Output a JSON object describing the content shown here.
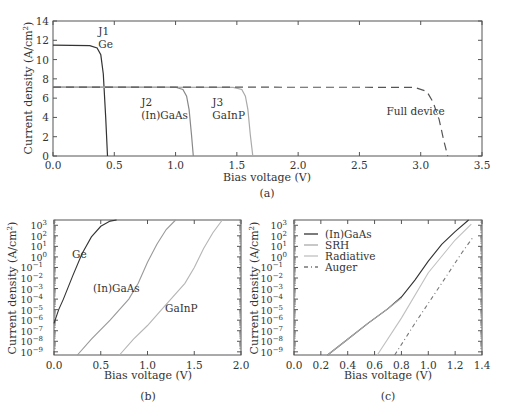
{
  "chart_data": [
    {
      "panel": "(a)",
      "type": "line",
      "title": "",
      "xlabel": "Bias voltage (V)",
      "ylabel": "Current density (A/cm²)",
      "xlim": [
        0,
        3.5
      ],
      "ylim": [
        0,
        14
      ],
      "xticks": [
        "0.0",
        "0.5",
        "1.0",
        "1.5",
        "2.0",
        "2.5",
        "3.0",
        "3.5"
      ],
      "yticks": [
        "0",
        "2",
        "4",
        "6",
        "8",
        "10",
        "12",
        "14"
      ],
      "grid": false,
      "series": [
        {
          "name": "J1 Ge",
          "style": "solid",
          "color": "#333333",
          "x": [
            0,
            0.3,
            0.36,
            0.39,
            0.41,
            0.43,
            0.445
          ],
          "y": [
            11.5,
            11.45,
            11.2,
            10.5,
            8.5,
            4,
            0
          ]
        },
        {
          "name": "J2 (In)GaAs",
          "style": "solid",
          "color": "#888888",
          "x": [
            0,
            1.0,
            1.06,
            1.09,
            1.11,
            1.13,
            1.145
          ],
          "y": [
            7.15,
            7.12,
            6.9,
            6.2,
            4.8,
            2.2,
            0
          ]
        },
        {
          "name": "J3 GaInP",
          "style": "solid",
          "color": "#aaaaaa",
          "x": [
            0,
            1.47,
            1.54,
            1.57,
            1.59,
            1.61,
            1.63
          ],
          "y": [
            7.15,
            7.12,
            6.9,
            6.2,
            4.8,
            2.2,
            0
          ]
        },
        {
          "name": "Full device",
          "style": "dashed",
          "color": "#555555",
          "x": [
            0,
            2.95,
            3.05,
            3.1,
            3.15,
            3.19,
            3.22
          ],
          "y": [
            7.15,
            7.12,
            6.7,
            5.6,
            3.8,
            1.5,
            0
          ]
        }
      ],
      "annotations": [
        {
          "text": "J1",
          "x": 0.37,
          "y": 12.5
        },
        {
          "text": "Ge",
          "x": 0.37,
          "y": 11.2
        },
        {
          "text": "J2",
          "x": 0.72,
          "y": 5.2
        },
        {
          "text": "(In)GaAs",
          "x": 0.72,
          "y": 3.8
        },
        {
          "text": "J3",
          "x": 1.3,
          "y": 5.2
        },
        {
          "text": "GaInP",
          "x": 1.3,
          "y": 3.8
        },
        {
          "text": "Full device",
          "x": 2.72,
          "y": 4.3
        }
      ]
    },
    {
      "panel": "(b)",
      "type": "line",
      "xlabel": "Bias voltage (V)",
      "ylabel": "Current density (A/cm²)",
      "xlim": [
        0,
        2.0
      ],
      "ylim": [
        "1e-9",
        "1e3"
      ],
      "yscale": "log",
      "xticks": [
        "0.0",
        "0.5",
        "1.0",
        "1.5",
        "2.0"
      ],
      "yticks": [
        "10^3",
        "10^2",
        "10^1",
        "10^0",
        "10^-1",
        "10^-2",
        "10^-3",
        "10^-4",
        "10^-5",
        "10^-6",
        "10^-7",
        "10^-8",
        "10^-9"
      ],
      "series": [
        {
          "name": "Ge",
          "style": "solid",
          "color": "#333333",
          "x": [
            0.0,
            0.05,
            0.1,
            0.2,
            0.3,
            0.4,
            0.5,
            0.6,
            0.67
          ],
          "log10_y": [
            -6.3,
            -5.0,
            -4.0,
            -1.8,
            0.3,
            1.9,
            2.9,
            3.4,
            3.5
          ]
        },
        {
          "name": "(In)GaAs",
          "style": "solid",
          "color": "#999999",
          "x": [
            0.25,
            0.4,
            0.6,
            0.8,
            0.9,
            1.0,
            1.1,
            1.2,
            1.3
          ],
          "log10_y": [
            -9.3,
            -7.8,
            -6.0,
            -4.0,
            -2.5,
            -0.5,
            1.2,
            2.6,
            3.5
          ]
        },
        {
          "name": "GaInP",
          "style": "solid",
          "color": "#b5b5b5",
          "x": [
            0.7,
            0.85,
            1.0,
            1.2,
            1.4,
            1.5,
            1.6,
            1.7,
            1.8
          ],
          "log10_y": [
            -9.3,
            -7.8,
            -6.5,
            -4.5,
            -2.5,
            -1.0,
            0.8,
            2.3,
            3.5
          ]
        }
      ],
      "annotations": [
        {
          "text": "Ge",
          "x": 0.3,
          "y": "10^1"
        },
        {
          "text": "(In)GaAs",
          "x": 0.55,
          "y": "10^-3"
        },
        {
          "text": "GaInP",
          "x": 1.1,
          "y": "10^-5"
        }
      ]
    },
    {
      "panel": "(c)",
      "type": "line",
      "xlabel": "Bias voltage (V)",
      "ylabel": "Current density (A/cm²)",
      "xlim": [
        0,
        1.4
      ],
      "ylim": [
        "1e-9",
        "1e3"
      ],
      "yscale": "log",
      "xticks": [
        "0.0",
        "0.2",
        "0.4",
        "0.6",
        "0.8",
        "1.0",
        "1.2",
        "1.4"
      ],
      "yticks": [
        "10^3",
        "10^2",
        "10^1",
        "10^0",
        "10^-1",
        "10^-2",
        "10^-3",
        "10^-4",
        "10^-5",
        "10^-6",
        "10^-7",
        "10^-8",
        "10^-9"
      ],
      "legend": [
        "(In)GaAs",
        "SRH",
        "Radiative",
        "Auger"
      ],
      "legend_position": "upper left",
      "series": [
        {
          "name": "(In)GaAs",
          "style": "solid",
          "color": "#333333",
          "x": [
            0.25,
            0.4,
            0.55,
            0.7,
            0.8,
            0.9,
            1.0,
            1.1,
            1.2,
            1.3
          ],
          "log10_y": [
            -9.3,
            -7.8,
            -6.3,
            -4.9,
            -3.8,
            -2.2,
            -0.4,
            1.2,
            2.4,
            3.5
          ]
        },
        {
          "name": "SRH",
          "style": "solid",
          "color": "#aaaaaa",
          "x": [
            0.25,
            0.4,
            0.55,
            0.7,
            0.8
          ],
          "log10_y": [
            -9.3,
            -7.8,
            -6.3,
            -4.9,
            -3.9
          ]
        },
        {
          "name": "Radiative",
          "style": "solid",
          "color": "#c0c0c0",
          "x": [
            0.62,
            0.8,
            1.0,
            1.2,
            1.32
          ],
          "log10_y": [
            -9.3,
            -5.8,
            -1.5,
            1.6,
            3.1
          ]
        },
        {
          "name": "Auger",
          "style": "dashdot",
          "color": "#777777",
          "x": [
            0.75,
            0.9,
            1.1,
            1.25,
            1.33
          ],
          "log10_y": [
            -9.3,
            -6.3,
            -2.5,
            0.4,
            1.8
          ]
        }
      ]
    }
  ],
  "captions": {
    "a": "(a)",
    "b": "(b)",
    "c": "(c)"
  },
  "labels": {
    "xlabel": "Bias voltage (V)",
    "ylabel_main": "Current density (A/cm",
    "ylabel_sup": "2",
    "ylabel_end": ")"
  }
}
